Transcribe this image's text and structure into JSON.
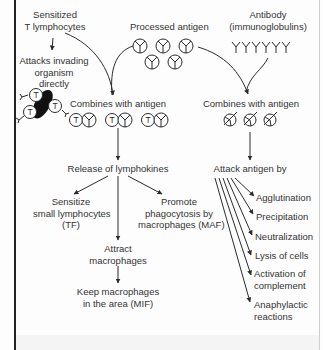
{
  "diagram": {
    "type": "flowchart",
    "topic": "Cell-mediated and humoral immune response",
    "colors": {
      "line": "#2b2b2b",
      "text": "#333333",
      "cell_fill": "#111111",
      "background": "#fdfdfd"
    },
    "nodes": {
      "sensitized_t": {
        "lines": [
          "Sensitized",
          "T lymphocytes"
        ]
      },
      "attacks_directly": {
        "lines": [
          "Attacks invading",
          "organism",
          "directly"
        ]
      },
      "processed_antigen": {
        "lines": [
          "Processed antigen"
        ]
      },
      "antibody": {
        "lines": [
          "Antibody",
          "(immunoglobulins)"
        ]
      },
      "combines_left": {
        "lines": [
          "Combines with antigen"
        ]
      },
      "combines_right": {
        "lines": [
          "Combines with antigen"
        ]
      },
      "release_lymphokines": {
        "lines": [
          "Release of lymphokines"
        ]
      },
      "sensitize_small": {
        "lines": [
          "Sensitize",
          "small lymphocytes",
          "(TF)"
        ]
      },
      "promote_phago": {
        "lines": [
          "Promote",
          "phagocytosis by",
          "macrophages (MAF)"
        ]
      },
      "attract_macro": {
        "lines": [
          "Attract",
          "macrophages"
        ]
      },
      "keep_macro": {
        "lines": [
          "Keep macrophages",
          "in the area (MIF)"
        ]
      },
      "attack_antigen_by": {
        "lines": [
          "Attack antigen by"
        ]
      },
      "mechanisms": [
        {
          "lines": [
            "Agglutination"
          ]
        },
        {
          "lines": [
            "Precipitation"
          ]
        },
        {
          "lines": [
            "Neutralization"
          ]
        },
        {
          "lines": [
            "Lysis of cells"
          ]
        },
        {
          "lines": [
            "Activation of",
            "complement"
          ]
        },
        {
          "lines": [
            "Anaphylactic",
            "reactions"
          ]
        }
      ]
    },
    "icons": {
      "t_cell_label": "T",
      "t_cell_cluster": "t-cells-attacking-organism-icon",
      "antigen": "processed-antigen-icon",
      "antibody": "antibody-y-icon",
      "t_antigen_pair": "t-cell-antigen-complex-icon",
      "antibody_antigen": "antibody-antigen-complex-icon"
    },
    "edges": [
      [
        "sensitized_t",
        "attacks_directly"
      ],
      [
        "sensitized_t",
        "combines_left"
      ],
      [
        "processed_antigen",
        "combines_left"
      ],
      [
        "processed_antigen",
        "combines_right"
      ],
      [
        "antibody",
        "combines_right"
      ],
      [
        "combines_left",
        "release_lymphokines"
      ],
      [
        "release_lymphokines",
        "sensitize_small"
      ],
      [
        "release_lymphokines",
        "promote_phago"
      ],
      [
        "release_lymphokines",
        "attract_macro"
      ],
      [
        "attract_macro",
        "keep_macro"
      ],
      [
        "combines_right",
        "attack_antigen_by"
      ],
      [
        "attack_antigen_by",
        "Agglutination"
      ],
      [
        "attack_antigen_by",
        "Precipitation"
      ],
      [
        "attack_antigen_by",
        "Neutralization"
      ],
      [
        "attack_antigen_by",
        "Lysis of cells"
      ],
      [
        "attack_antigen_by",
        "Activation of complement"
      ],
      [
        "attack_antigen_by",
        "Anaphylactic reactions"
      ]
    ]
  }
}
